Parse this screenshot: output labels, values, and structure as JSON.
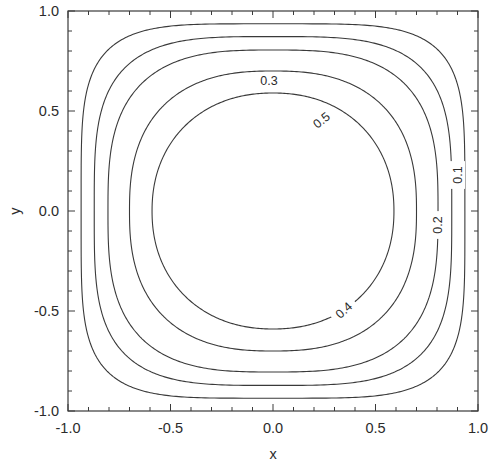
{
  "figure": {
    "background_color": "#ffffff",
    "line_color": "#3a3a3a",
    "text_color": "#2b2b2b",
    "frame": {
      "left": 68,
      "top": 11,
      "right": 478,
      "bottom": 411
    }
  },
  "axes": {
    "x_label": "x",
    "y_label": "y",
    "x_ticks": [
      "-1.0",
      "-0.5",
      "0.0",
      "0.5",
      "1.0"
    ],
    "y_ticks": [
      "1.0",
      "0.5",
      "0.0",
      "-0.5",
      "-1.0"
    ]
  },
  "chart_data": {
    "type": "line",
    "title": "",
    "subtitle": "",
    "xlabel": "x",
    "ylabel": "y",
    "xlim": [
      -1.0,
      1.0
    ],
    "ylim": [
      -1.0,
      1.0
    ],
    "xticks": [
      -1.0,
      -0.5,
      0.0,
      0.5,
      1.0
    ],
    "yticks": [
      -1.0,
      -0.5,
      0.0,
      0.5,
      1.0
    ],
    "xticklabels": [
      "-1.0",
      "-0.5",
      "0.0",
      "0.5",
      "1.0"
    ],
    "yticklabels": [
      "-1.0",
      "-0.5",
      "0.0",
      "0.5",
      "1.0"
    ],
    "minor_tick_step": 0.1,
    "grid": false,
    "legend": null,
    "plot_kind": "contour",
    "function": "z = cos(pi*x/2) * cos(pi*y/2)",
    "levels": [
      0.1,
      0.2,
      0.3,
      0.4,
      0.5
    ],
    "level_labels": [
      "0.1",
      "0.2",
      "0.3",
      "0.4",
      "0.5"
    ],
    "contours": [
      {
        "level": 0.1,
        "label": "0.1",
        "label_position": {
          "x": 0.9,
          "y": 0.18
        },
        "label_rotation": -90,
        "x_intercept": 0.936,
        "y_intercept": 0.936,
        "superellipse_exponent": 4.6
      },
      {
        "level": 0.2,
        "label": "0.2",
        "label_position": {
          "x": 0.8,
          "y": -0.07
        },
        "label_rotation": -90,
        "x_intercept": 0.872,
        "y_intercept": 0.872,
        "superellipse_exponent": 3.6
      },
      {
        "level": 0.3,
        "label": "0.3",
        "label_position": {
          "x": -0.02,
          "y": 0.655
        },
        "label_rotation": 0,
        "x_intercept": 0.805,
        "y_intercept": 0.805,
        "superellipse_exponent": 3.0
      },
      {
        "level": 0.4,
        "label": "0.4",
        "label_position": {
          "x": 0.345,
          "y": -0.495
        },
        "label_rotation": -42,
        "x_intercept": 0.7,
        "y_intercept": 0.7,
        "superellipse_exponent": 2.5
      },
      {
        "level": 0.5,
        "label": "0.5",
        "label_position": {
          "x": 0.235,
          "y": 0.455
        },
        "label_rotation": -38,
        "x_intercept": 0.59,
        "y_intercept": 0.59,
        "superellipse_exponent": 2.15
      }
    ]
  }
}
